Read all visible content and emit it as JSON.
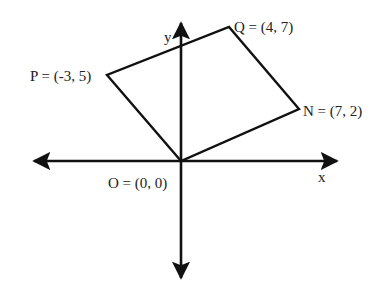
{
  "diagram": {
    "colors": {
      "stroke": "#111111",
      "text": "#222222",
      "background": "#ffffff"
    },
    "axes": {
      "x_label": "x",
      "y_label": "y"
    },
    "points": [
      {
        "name": "O",
        "label": "O = (0, 0)",
        "x": 0,
        "y": 0
      },
      {
        "name": "P",
        "label": "P = (-3, 5)",
        "x": -3,
        "y": 5
      },
      {
        "name": "Q",
        "label": "Q = (4, 7)",
        "x": 4,
        "y": 7
      },
      {
        "name": "N",
        "label": "N = (7, 2)",
        "x": 7,
        "y": 2
      }
    ],
    "polygon": [
      "O",
      "P",
      "Q",
      "N"
    ]
  }
}
